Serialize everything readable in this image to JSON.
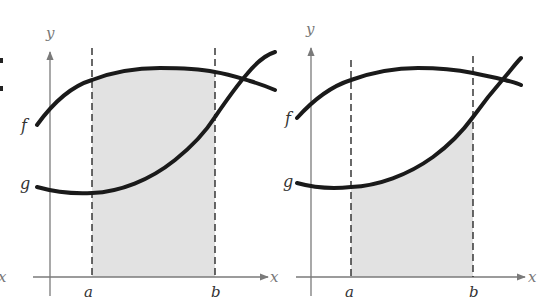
{
  "diagram": {
    "type": "area-between-curves-illustration",
    "panels": [
      {
        "id": "left",
        "description": "Region under f between x=a and x=b shaded",
        "axis_labels": {
          "x": "x",
          "y": "y"
        },
        "bound_labels": {
          "a": "a",
          "b": "b"
        },
        "curve_labels": {
          "f": "f",
          "g": "g"
        },
        "shaded_under": "f"
      },
      {
        "id": "right",
        "description": "Region under g between x=a and x=b shaded",
        "axis_labels": {
          "x": "x",
          "y": "y"
        },
        "bound_labels": {
          "a": "a",
          "b": "b"
        },
        "curve_labels": {
          "f": "f",
          "g": "g"
        },
        "shaded_under": "g"
      }
    ],
    "edge_fragments": {
      "left_x_label": "x"
    },
    "colors": {
      "curve": "#1a1a1a",
      "axis": "#7a7a7a",
      "shade": "#e2e2e2",
      "dashed": "#2a2a2a"
    }
  }
}
